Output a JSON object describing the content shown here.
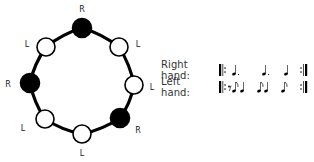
{
  "diagram": {
    "type": "hand-pattern-circle",
    "nodes": [
      {
        "hand": "R",
        "filled": true,
        "cx": 82,
        "cy": 28,
        "label_x": 82,
        "label_y": 9
      },
      {
        "hand": "L",
        "filled": false,
        "cx": 119,
        "cy": 47,
        "label_x": 138,
        "label_y": 44
      },
      {
        "hand": "L",
        "filled": false,
        "cx": 134,
        "cy": 85,
        "label_x": 152,
        "label_y": 87
      },
      {
        "hand": "R",
        "filled": true,
        "cx": 120,
        "cy": 118,
        "label_x": 138,
        "label_y": 130
      },
      {
        "hand": "L",
        "filled": false,
        "cx": 82,
        "cy": 134,
        "label_x": 82,
        "label_y": 153
      },
      {
        "hand": "L",
        "filled": false,
        "cx": 45,
        "cy": 119,
        "label_x": 23,
        "label_y": 128
      },
      {
        "hand": "R",
        "filled": true,
        "cx": 30,
        "cy": 83,
        "label_x": 8,
        "label_y": 84
      },
      {
        "hand": "L",
        "filled": false,
        "cx": 46,
        "cy": 47,
        "label_x": 27,
        "label_y": 44
      }
    ],
    "ring": {
      "cx": 82,
      "cy": 81,
      "r": 53
    }
  },
  "legend": {
    "right_hand": {
      "label": "Right hand:",
      "notation": [
        "repeat-start",
        "dotted-quarter",
        "dotted-quarter",
        "quarter",
        "repeat-end"
      ]
    },
    "left_hand": {
      "label": "Left hand:",
      "notation": [
        "repeat-start",
        "eighth-rest",
        "eighth",
        "quarter",
        "eighth",
        "quarter",
        "eighth",
        "repeat-end"
      ]
    }
  },
  "colors": {
    "stroke": "#000000",
    "filled": "#000000",
    "empty": "#ffffff"
  }
}
